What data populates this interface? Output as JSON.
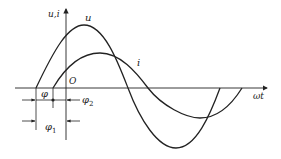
{
  "diagram": {
    "type": "phase-difference waveform",
    "axes": {
      "y_label": "u,i",
      "x_label": "ωt",
      "origin_label": "O"
    },
    "curves": [
      {
        "name": "u",
        "label": "u",
        "description": "voltage sine wave, larger amplitude, leads"
      },
      {
        "name": "i",
        "label": "i",
        "description": "current sine wave, smaller amplitude, lags"
      }
    ],
    "annotations": {
      "phi": "φ",
      "phi1": "φ",
      "phi1_sub": "1",
      "phi2": "φ",
      "phi2_sub": "2"
    },
    "colors": {
      "line": "#222222",
      "background": "#ffffff"
    }
  }
}
